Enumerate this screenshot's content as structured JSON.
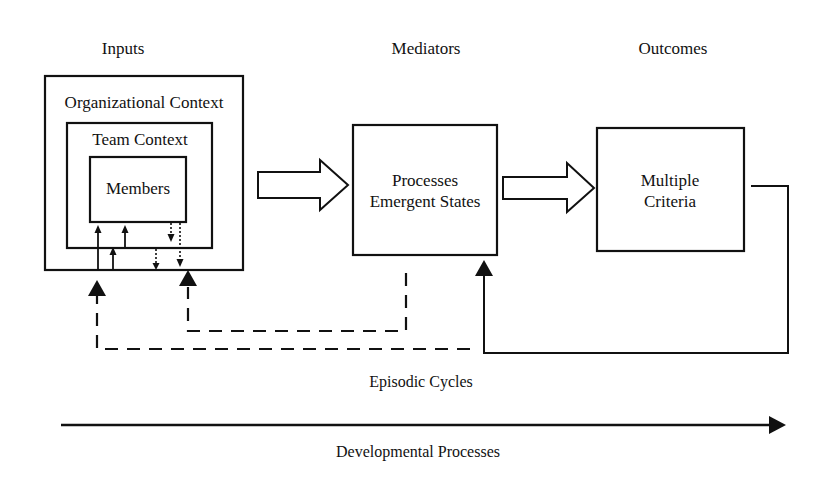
{
  "headers": {
    "inputs": "Inputs",
    "mediators": "Mediators",
    "outcomes": "Outcomes"
  },
  "inputs": {
    "organizational_context": "Organizational Context",
    "team_context": "Team Context",
    "members": "Members"
  },
  "mediators": {
    "line1": "Processes",
    "line2": "Emergent States"
  },
  "outcomes": {
    "line1": "Multiple",
    "line2": "Criteria"
  },
  "cycles": {
    "episodic_label": "Episodic Cycles",
    "developmental_label": "Developmental Processes"
  },
  "style": {
    "stroke_color": "#111111",
    "background": "#ffffff"
  }
}
